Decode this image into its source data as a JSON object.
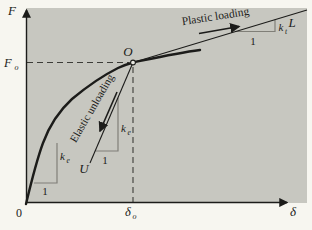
{
  "colors": {
    "page-bg": "#f7f6f0",
    "plot-bg": "#c7c7c0",
    "ink": "#1c1c1a",
    "muted": "#807f78",
    "dash": "#3c3c38"
  },
  "axes": {
    "y_label": "F",
    "x_label": "δ",
    "origin": "0"
  },
  "tick_labels": {
    "fo_main": "F",
    "fo_sub": "o",
    "delta_o_main": "δ",
    "delta_o_sub": "o"
  },
  "points": {
    "o": "O",
    "u": "U",
    "l": "L"
  },
  "slopes": {
    "k": "k",
    "e_sub": "e",
    "t_sub": "t",
    "run": "1"
  },
  "annotations": {
    "plastic": "Plastic loading",
    "elastic": "Elastic unloading"
  }
}
